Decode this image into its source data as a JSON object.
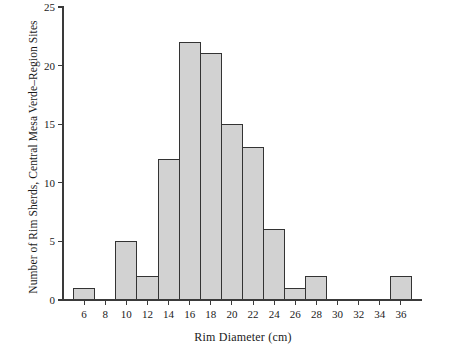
{
  "chart_data": {
    "type": "bar",
    "title": "",
    "xlabel": "Rim Diameter (cm)",
    "ylabel": "Number of Rim Sherds, Central Mesa Verde–Region Sites",
    "categories": [
      6,
      8,
      10,
      12,
      14,
      16,
      18,
      20,
      22,
      24,
      26,
      28,
      30,
      32,
      34,
      36
    ],
    "values": [
      1,
      0,
      5,
      2,
      12,
      22,
      21,
      15,
      13,
      6,
      1,
      2,
      0,
      0,
      0,
      2
    ],
    "bin_width": 2,
    "xlim": [
      4,
      38
    ],
    "ylim": [
      0,
      25.8
    ],
    "xticks": [
      6,
      8,
      10,
      12,
      14,
      16,
      18,
      20,
      22,
      24,
      26,
      28,
      30,
      32,
      34,
      36
    ],
    "xtick_labels": [
      "6",
      "8",
      "10",
      "12",
      "14",
      "16",
      "18",
      "20",
      "22",
      "24",
      "26",
      "28",
      "30",
      "32",
      "34",
      "36"
    ],
    "yticks": [
      0,
      5,
      10,
      15,
      20,
      25
    ],
    "ytick_labels": [
      "0",
      "5",
      "10",
      "15",
      "20",
      "25"
    ],
    "grid": false,
    "legend": null,
    "bar_fill_color": "#d2d2d2",
    "bar_edge_color": "#333333",
    "axis_color": "#3a3a3a",
    "background_color": "#ffffff"
  }
}
